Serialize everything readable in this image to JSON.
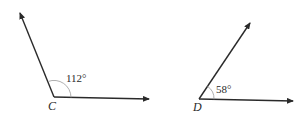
{
  "diagram": {
    "angles": [
      {
        "id": "angle-c",
        "vertex_label": "C",
        "measure_label": "112°",
        "measure": 112
      },
      {
        "id": "angle-d",
        "vertex_label": "D",
        "measure_label": "58°",
        "measure": 58
      }
    ]
  },
  "colors": {
    "line": "#2a2a2a",
    "arc": "#9a9a9a",
    "background": "#ffffff"
  }
}
